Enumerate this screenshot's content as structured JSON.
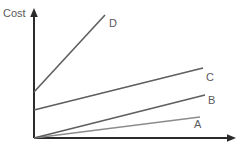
{
  "chart_data": {
    "type": "line",
    "title": "",
    "xlabel": "",
    "ylabel": "Cost",
    "grid": false,
    "legend_position": "inline-right-end-of-line",
    "axes": {
      "x_axis_name": "x-axis-arrow",
      "y_axis_name": "y-axis-arrow",
      "origin_label": "",
      "x_ticks": [],
      "y_ticks": [],
      "xlim": [
        0,
        100
      ],
      "ylim": [
        0,
        100
      ]
    },
    "annotations": [
      {
        "label": "Cost",
        "name": "y-axis-title"
      }
    ],
    "series": [
      {
        "name": "A",
        "label": "A",
        "color": "#8c8c8c",
        "x": [
          0,
          100
        ],
        "y": [
          0,
          16
        ],
        "intercept": 0,
        "slope": 0.16,
        "description": "lowest, shallowest line through origin"
      },
      {
        "name": "B",
        "label": "B",
        "color": "#5e5e5e",
        "x": [
          0,
          100
        ],
        "y": [
          0,
          33
        ],
        "intercept": 0,
        "slope": 0.33,
        "description": "second line through origin, steeper than A"
      },
      {
        "name": "C",
        "label": "C",
        "color": "#5e5e5e",
        "x": [
          0,
          100
        ],
        "y": [
          22,
          54
        ],
        "intercept": 22,
        "slope": 0.32,
        "description": "line with positive y-intercept, moderate slope"
      },
      {
        "name": "D",
        "label": "D",
        "color": "#5e5e5e",
        "x": [
          0,
          42
        ],
        "y": [
          36,
          95
        ],
        "intercept": 36,
        "slope": 1.42,
        "description": "steepest line, high y-intercept, short run"
      }
    ]
  },
  "geometry": {
    "origin": {
      "x": 34,
      "y": 138
    },
    "y_axis_top": {
      "x": 34,
      "y": 9
    },
    "x_axis_right": {
      "x": 236,
      "y": 138
    },
    "lines": {
      "A": {
        "x1": 34,
        "y1": 138,
        "x2": 200,
        "y2": 117
      },
      "B": {
        "x1": 34,
        "y1": 138,
        "x2": 205,
        "y2": 95
      },
      "C": {
        "x1": 34,
        "y1": 110,
        "x2": 203,
        "y2": 68
      },
      "D": {
        "x1": 34,
        "y1": 92,
        "x2": 105,
        "y2": 15
      }
    },
    "labels": {
      "cost": {
        "x": 3,
        "y": 17
      },
      "A": {
        "x": 194,
        "y": 128
      },
      "B": {
        "x": 208,
        "y": 104
      },
      "C": {
        "x": 206,
        "y": 81
      },
      "D": {
        "x": 109,
        "y": 27
      }
    }
  },
  "colors": {
    "background": "#ffffff",
    "axis": "#2b2b2b",
    "line_dark": "#5e5e5e",
    "line_light": "#8c8c8c",
    "text": "#5a5a5a"
  }
}
